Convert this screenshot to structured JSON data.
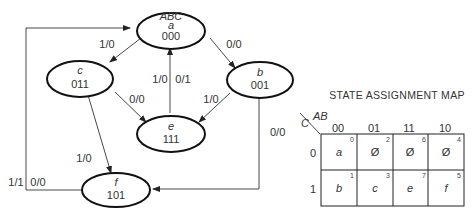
{
  "diagram": {
    "header_label": "ABC",
    "states": [
      {
        "id": "a",
        "name": "a",
        "code": "000"
      },
      {
        "id": "b",
        "name": "b",
        "code": "001"
      },
      {
        "id": "c",
        "name": "c",
        "code": "011"
      },
      {
        "id": "e",
        "name": "e",
        "code": "111"
      },
      {
        "id": "f",
        "name": "f",
        "code": "101"
      }
    ],
    "transitions": [
      {
        "from": "a",
        "to": "c",
        "label": "1/0"
      },
      {
        "from": "a",
        "to": "b",
        "label": "0/0"
      },
      {
        "from": "c",
        "to": "e",
        "label": "0/0"
      },
      {
        "from": "c",
        "to": "f",
        "label": "1/0"
      },
      {
        "from": "b",
        "to": "e",
        "label": "1/0"
      },
      {
        "from": "b",
        "to": "f",
        "label": "0/0"
      },
      {
        "from": "e",
        "to": "a",
        "label_left": "1/0",
        "label_right": "0/1"
      },
      {
        "from": "f",
        "to": "a",
        "label_left": "1/1",
        "label_right": "0/0"
      }
    ]
  },
  "map": {
    "title": "STATE ASSIGNMENT MAP",
    "row_var": "C",
    "col_var": "AB",
    "col_headers": [
      "00",
      "01",
      "11",
      "10"
    ],
    "row_headers": [
      "0",
      "1"
    ],
    "cells": [
      [
        {
          "value": "a",
          "index": "0"
        },
        {
          "value": "Ø",
          "index": "2"
        },
        {
          "value": "Ø",
          "index": "6"
        },
        {
          "value": "Ø",
          "index": "4"
        }
      ],
      [
        {
          "value": "b",
          "index": "1"
        },
        {
          "value": "c",
          "index": "3"
        },
        {
          "value": "e",
          "index": "7"
        },
        {
          "value": "f",
          "index": "5"
        }
      ]
    ]
  }
}
